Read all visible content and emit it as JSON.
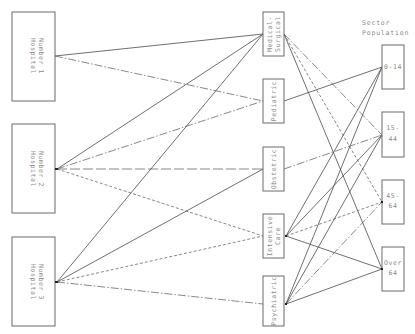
{
  "diagram": {
    "header": {
      "line1": "Sector",
      "line2": "Population"
    },
    "hospitals": [
      {
        "line1": "Hospital",
        "line2": "Number 1"
      },
      {
        "line1": "Hospital",
        "line2": "Number 2"
      },
      {
        "line1": "Hospital",
        "line2": "Number 3"
      }
    ],
    "services": [
      {
        "line1": "Medical-",
        "line2": "Surgical"
      },
      {
        "line1": "Pediatric",
        "line2": ""
      },
      {
        "line1": "Obstetric",
        "line2": ""
      },
      {
        "line1": "Intensive",
        "line2": "Care"
      },
      {
        "line1": "Psychiatric",
        "line2": ""
      }
    ],
    "populations": [
      {
        "line1": "0-14",
        "line2": ""
      },
      {
        "line1": "15-",
        "line2": "44"
      },
      {
        "line1": "45-",
        "line2": "64"
      },
      {
        "line1": "Over",
        "line2": "64"
      }
    ],
    "connections_hospital_to_service": [
      {
        "from": "Hospital Number 1",
        "to": "Medical-Surgical",
        "style": "solid"
      },
      {
        "from": "Hospital Number 1",
        "to": "Pediatric",
        "style": "dash-dot"
      },
      {
        "from": "Hospital Number 2",
        "to": "Medical-Surgical",
        "style": "solid"
      },
      {
        "from": "Hospital Number 2",
        "to": "Pediatric",
        "style": "dash-dot"
      },
      {
        "from": "Hospital Number 2",
        "to": "Obstetric",
        "style": "long-dash"
      },
      {
        "from": "Hospital Number 2",
        "to": "Intensive Care",
        "style": "short-dash"
      },
      {
        "from": "Hospital Number 3",
        "to": "Medical-Surgical",
        "style": "solid"
      },
      {
        "from": "Hospital Number 3",
        "to": "Obstetric",
        "style": "solid"
      },
      {
        "from": "Hospital Number 3",
        "to": "Intensive Care",
        "style": "short-dash"
      },
      {
        "from": "Hospital Number 3",
        "to": "Psychiatric",
        "style": "dash-dot"
      }
    ],
    "connections_service_to_population": [
      {
        "from": "Medical-Surgical",
        "to": "15-44",
        "style": "dash-dot"
      },
      {
        "from": "Medical-Surgical",
        "to": "45-64",
        "style": "short-dash"
      },
      {
        "from": "Medical-Surgical",
        "to": "Over 64",
        "style": "solid"
      },
      {
        "from": "Pediatric",
        "to": "0-14",
        "style": "solid"
      },
      {
        "from": "Obstetric",
        "to": "15-44",
        "style": "dash-dot"
      },
      {
        "from": "Intensive Care",
        "to": "0-14",
        "style": "solid"
      },
      {
        "from": "Intensive Care",
        "to": "15-44",
        "style": "solid"
      },
      {
        "from": "Intensive Care",
        "to": "45-64",
        "style": "short-dash"
      },
      {
        "from": "Intensive Care",
        "to": "Over 64",
        "style": "solid"
      },
      {
        "from": "Psychiatric",
        "to": "0-14",
        "style": "solid"
      },
      {
        "from": "Psychiatric",
        "to": "15-44",
        "style": "solid"
      },
      {
        "from": "Psychiatric",
        "to": "45-64",
        "style": "dash-dot"
      },
      {
        "from": "Psychiatric",
        "to": "Over 64",
        "style": "solid"
      }
    ]
  }
}
